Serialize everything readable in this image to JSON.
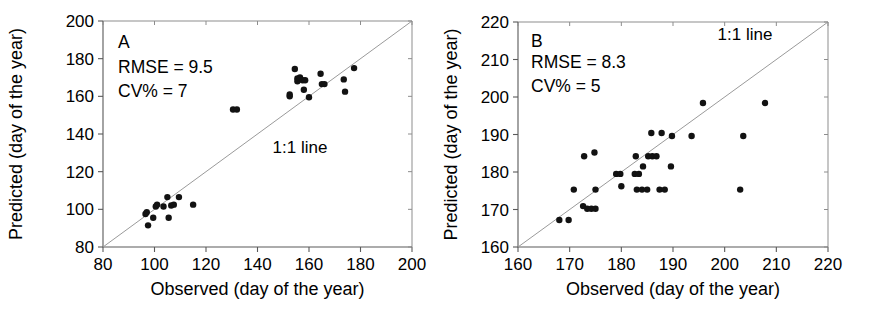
{
  "figure": {
    "title": "",
    "panel_count": 2
  },
  "chart_data": [
    {
      "type": "scatter",
      "panel": "A",
      "title": "",
      "xlabel": "Observed (day of the year)",
      "ylabel": "Predicted (day of the year)",
      "xlim": [
        80,
        200
      ],
      "ylim": [
        80,
        200
      ],
      "xticks": [
        80,
        100,
        120,
        140,
        160,
        180,
        200
      ],
      "yticks": [
        80,
        100,
        120,
        140,
        160,
        180,
        200
      ],
      "grid": false,
      "legend": "none",
      "annotations": [
        {
          "name": "panel-letter",
          "text": "A"
        },
        {
          "name": "rmse",
          "text": "RMSE = 9.5"
        },
        {
          "name": "cv",
          "text": "CV%    = 7"
        },
        {
          "name": "one-to-one-label",
          "text": "1:1 line"
        }
      ],
      "reference_line": {
        "name": "1:1 line",
        "from": [
          80,
          80
        ],
        "to": [
          200,
          200
        ]
      },
      "points": [
        {
          "x": 97.5,
          "y": 91.5
        },
        {
          "x": 96.5,
          "y": 97.5
        },
        {
          "x": 97.0,
          "y": 98.5
        },
        {
          "x": 99.5,
          "y": 95.5
        },
        {
          "x": 100.5,
          "y": 101.5
        },
        {
          "x": 101.0,
          "y": 102.5
        },
        {
          "x": 103.5,
          "y": 101.5
        },
        {
          "x": 105.0,
          "y": 106.5
        },
        {
          "x": 105.5,
          "y": 95.5
        },
        {
          "x": 106.5,
          "y": 102.0
        },
        {
          "x": 107.5,
          "y": 102.5
        },
        {
          "x": 109.5,
          "y": 106.5
        },
        {
          "x": 115.0,
          "y": 102.5
        },
        {
          "x": 130.5,
          "y": 153.0
        },
        {
          "x": 132.0,
          "y": 153.0
        },
        {
          "x": 152.5,
          "y": 161.0
        },
        {
          "x": 152.5,
          "y": 160.0
        },
        {
          "x": 154.5,
          "y": 174.5
        },
        {
          "x": 155.5,
          "y": 169.5
        },
        {
          "x": 155.5,
          "y": 168.0
        },
        {
          "x": 156.5,
          "y": 170.0
        },
        {
          "x": 157.5,
          "y": 168.5
        },
        {
          "x": 158.5,
          "y": 168.5
        },
        {
          "x": 158.0,
          "y": 163.5
        },
        {
          "x": 160.0,
          "y": 159.5
        },
        {
          "x": 164.5,
          "y": 172.0
        },
        {
          "x": 165.0,
          "y": 166.5
        },
        {
          "x": 166.0,
          "y": 166.5
        },
        {
          "x": 173.5,
          "y": 169.0
        },
        {
          "x": 174.0,
          "y": 162.5
        },
        {
          "x": 177.5,
          "y": 175.0
        }
      ]
    },
    {
      "type": "scatter",
      "panel": "B",
      "title": "",
      "xlabel": "Observed (day of the year)",
      "ylabel": "Predicted (day of the year)",
      "xlim": [
        160,
        220
      ],
      "ylim": [
        160,
        220
      ],
      "xticks": [
        160,
        170,
        180,
        190,
        200,
        210,
        220
      ],
      "yticks": [
        160,
        170,
        180,
        190,
        200,
        210,
        220
      ],
      "grid": false,
      "legend": "none",
      "annotations": [
        {
          "name": "panel-letter",
          "text": "B"
        },
        {
          "name": "rmse",
          "text": "RMSE = 8.3"
        },
        {
          "name": "cv",
          "text": "CV%    = 5"
        },
        {
          "name": "one-to-one-label",
          "text": "1:1 line"
        }
      ],
      "reference_line": {
        "name": "1:1 line",
        "from": [
          160,
          160
        ],
        "to": [
          220,
          220
        ]
      },
      "points": [
        {
          "x": 168.0,
          "y": 167.2
        },
        {
          "x": 169.8,
          "y": 167.2
        },
        {
          "x": 170.8,
          "y": 175.3
        },
        {
          "x": 172.6,
          "y": 170.9
        },
        {
          "x": 172.8,
          "y": 184.2
        },
        {
          "x": 173.4,
          "y": 170.2
        },
        {
          "x": 174.2,
          "y": 170.2
        },
        {
          "x": 175.0,
          "y": 170.2
        },
        {
          "x": 174.8,
          "y": 185.2
        },
        {
          "x": 175.0,
          "y": 175.3
        },
        {
          "x": 179.0,
          "y": 179.5
        },
        {
          "x": 179.8,
          "y": 179.5
        },
        {
          "x": 180.0,
          "y": 176.2
        },
        {
          "x": 182.6,
          "y": 179.5
        },
        {
          "x": 183.4,
          "y": 179.5
        },
        {
          "x": 182.8,
          "y": 184.2
        },
        {
          "x": 183.0,
          "y": 175.3
        },
        {
          "x": 184.0,
          "y": 175.3
        },
        {
          "x": 185.0,
          "y": 175.3
        },
        {
          "x": 184.2,
          "y": 181.5
        },
        {
          "x": 185.2,
          "y": 184.2
        },
        {
          "x": 186.0,
          "y": 184.2
        },
        {
          "x": 186.8,
          "y": 184.2
        },
        {
          "x": 185.8,
          "y": 190.4
        },
        {
          "x": 187.8,
          "y": 190.4
        },
        {
          "x": 187.4,
          "y": 175.3
        },
        {
          "x": 188.4,
          "y": 175.3
        },
        {
          "x": 189.6,
          "y": 181.5
        },
        {
          "x": 189.8,
          "y": 189.6
        },
        {
          "x": 193.6,
          "y": 189.6
        },
        {
          "x": 195.8,
          "y": 198.4
        },
        {
          "x": 203.0,
          "y": 175.3
        },
        {
          "x": 203.6,
          "y": 189.6
        },
        {
          "x": 207.8,
          "y": 198.4
        }
      ]
    }
  ]
}
